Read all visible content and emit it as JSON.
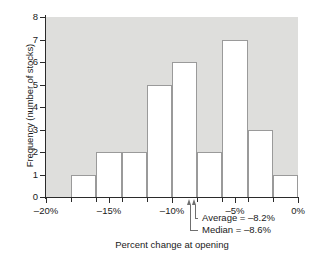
{
  "chart_data": {
    "type": "bar",
    "title": "",
    "xlabel": "Percent change at opening",
    "ylabel": "Frequency (number of stocks)",
    "categories": [
      "-20% to -18%",
      "-18% to -16%",
      "-16% to -14%",
      "-14% to -12%",
      "-12% to -10%",
      "-10% to -8%",
      "-8% to -6%",
      "-6% to -4%",
      "-4% to -2%",
      "-2% to 0%"
    ],
    "bin_edges": [
      -20,
      -18,
      -16,
      -14,
      -12,
      -10,
      -8,
      -6,
      -4,
      -2,
      0
    ],
    "values": [
      0,
      1,
      2,
      2,
      5,
      6,
      2,
      7,
      3,
      1
    ],
    "xlim": [
      -20,
      0
    ],
    "ylim": [
      0,
      8
    ],
    "xticks": [
      -20,
      -15,
      -10,
      -5,
      0
    ],
    "xtick_labels": [
      "–20%",
      "–15%",
      "–10%",
      "–5%",
      "0%"
    ],
    "xticks_minor": [
      -18,
      -16,
      -14,
      -12,
      -8,
      -6,
      -4,
      -2
    ],
    "yticks": [
      0,
      1,
      2,
      3,
      4,
      5,
      6,
      7,
      8
    ],
    "ytick_labels": [
      "0",
      "1",
      "2",
      "3",
      "4",
      "5",
      "6",
      "7",
      "8"
    ],
    "grid": false,
    "legend": "none",
    "plot_background": "#dededc",
    "bar_fill": "#ffffff",
    "bar_edge": "#9a9a9a",
    "annotations": [
      {
        "name": "average",
        "label": "Average = –8.2%",
        "value": -8.2
      },
      {
        "name": "median",
        "label": "Median = –8.6%",
        "value": -8.6
      }
    ]
  }
}
